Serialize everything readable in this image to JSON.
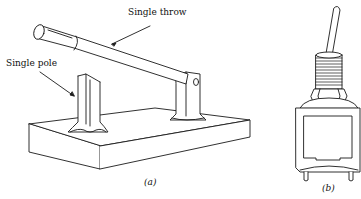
{
  "figure": {
    "panel_a": {
      "caption": "(a)",
      "labels": {
        "throw": "Single throw",
        "pole": "Single pole"
      },
      "description": "Knife switch on insulating base"
    },
    "panel_b": {
      "caption": "(b)",
      "description": "Toggle switch"
    }
  },
  "colors": {
    "line": "#1a1a1a",
    "background": "#ffffff"
  }
}
